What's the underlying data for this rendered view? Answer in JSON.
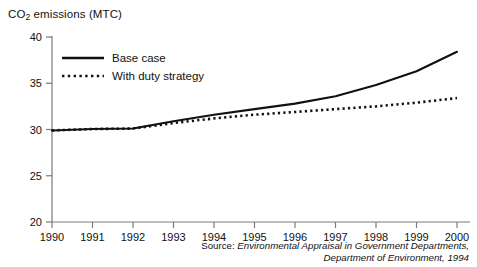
{
  "chart_data": {
    "type": "line",
    "title": "",
    "ylabel": "CO2 emissions (MTC)",
    "ylabel_prefix": "CO",
    "ylabel_sub": "2",
    "ylabel_suffix": " emissions (MTC)",
    "xlabel": "",
    "x": [
      1990,
      1991,
      1992,
      1993,
      1994,
      1995,
      1996,
      1997,
      1998,
      1999,
      2000
    ],
    "xtick_labels": [
      "1990",
      "1991",
      "1992",
      "1993",
      "1994",
      "1995",
      "1996",
      "1997",
      "1998",
      "1999",
      "2000"
    ],
    "ytick_labels": [
      "20",
      "25",
      "30",
      "35",
      "40"
    ],
    "yticks": [
      20,
      25,
      30,
      35,
      40
    ],
    "ylim": [
      20,
      40
    ],
    "xlim": [
      1990,
      2000
    ],
    "grid": false,
    "legend_position": "top-left-inside",
    "series": [
      {
        "name": "Base case",
        "style": "solid",
        "color": "#111111",
        "values": [
          29.9,
          30.05,
          30.1,
          30.9,
          31.6,
          32.2,
          32.8,
          33.6,
          34.8,
          36.3,
          38.4
        ]
      },
      {
        "name": "With duty strategy",
        "style": "dotted",
        "color": "#111111",
        "values": [
          29.9,
          30.05,
          30.1,
          30.7,
          31.2,
          31.6,
          31.9,
          32.2,
          32.5,
          32.9,
          33.4
        ]
      }
    ],
    "annotations": []
  },
  "legend": {
    "items": [
      {
        "label": "Base case",
        "style": "solid"
      },
      {
        "label": "With duty strategy",
        "style": "dotted"
      }
    ]
  },
  "source": {
    "prefix": "Source:",
    "line1": "Environmental Appraisal in Government Departments,",
    "line2": "Department of Environment, 1994"
  }
}
